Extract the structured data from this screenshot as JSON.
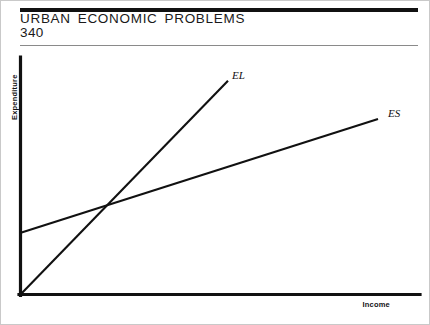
{
  "page": {
    "title": "URBAN ECONOMIC PROBLEMS",
    "page_number": "340",
    "background_color": "#ffffff",
    "ink_color": "#111111",
    "frame_color": "#c9c9c9",
    "rule_color": "#8a8a8a"
  },
  "chart_data": {
    "type": "line",
    "title": "",
    "subtitle": "",
    "xlabel": "Income",
    "ylabel": "Expenditure",
    "xlim": [
      0,
      100
    ],
    "ylim": [
      0,
      100
    ],
    "grid": false,
    "axis_ticks": false,
    "legend": "inline-end-labels",
    "annotations": [
      {
        "text": "EL",
        "x": 52,
        "y": 90,
        "style": "italic",
        "describes": "large-city expenditure line"
      },
      {
        "text": "ES",
        "x": 91,
        "y": 74,
        "style": "italic",
        "describes": "small-city expenditure line"
      }
    ],
    "series": [
      {
        "name": "EL",
        "label": "EL",
        "description": "Expenditure in large cities — steep slope, passes through origin",
        "x": [
          0,
          52
        ],
        "y": [
          0,
          90
        ],
        "intercept": 0,
        "slope": 1.73
      },
      {
        "name": "ES",
        "label": "ES",
        "description": "Expenditure in small cities — shallow slope, positive intercept",
        "x": [
          0,
          89.5
        ],
        "y": [
          26,
          74
        ],
        "intercept": 26,
        "slope": 0.536
      }
    ],
    "intersection": {
      "x": 22,
      "y": 37.8
    }
  },
  "geometry": {
    "origin_x": 20,
    "origin_y": 295,
    "y_axis_top": 57,
    "x_axis_right": 420,
    "el_end_x": 228,
    "el_end_y": 80,
    "es_start_x": 20,
    "es_start_y": 233,
    "es_end_x": 378,
    "es_end_y": 119
  },
  "labels": {
    "el": "EL",
    "es": "ES",
    "y_axis": "Expenditure",
    "x_axis": "Income"
  }
}
